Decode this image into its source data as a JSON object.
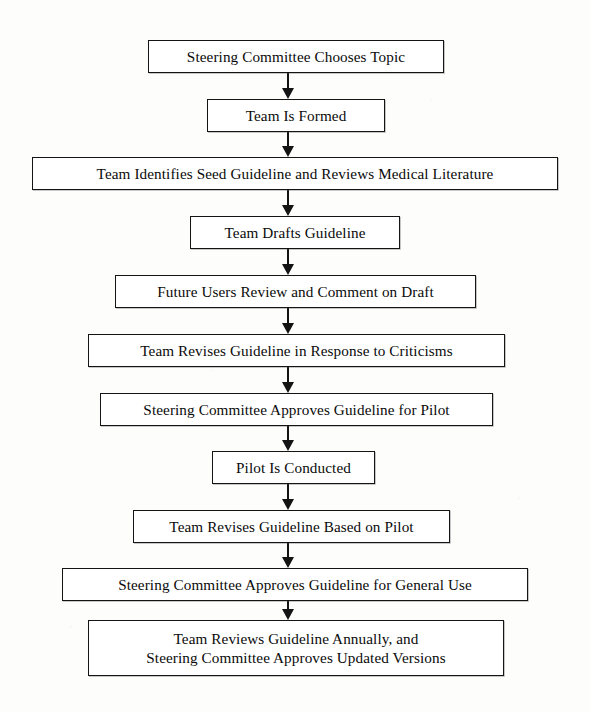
{
  "diagram": {
    "type": "flowchart",
    "orientation": "top-to-bottom",
    "title": "",
    "style": {
      "node_fill": "#ffffff",
      "node_border": "#141414",
      "text_color": "#0a0a0a",
      "arrow_color": "#141414",
      "page_background": "#fdfdfc"
    },
    "nodes": [
      {
        "id": "n1",
        "label": "Steering Committee Chooses Topic",
        "shape": "rectangle",
        "x": 148,
        "y": 40,
        "width": 296,
        "height": 33
      },
      {
        "id": "n2",
        "label": "Team Is Formed",
        "shape": "rectangle",
        "x": 207,
        "y": 99,
        "width": 178,
        "height": 33
      },
      {
        "id": "n3",
        "label": "Team Identifies Seed Guideline and Reviews Medical Literature",
        "shape": "rectangle",
        "x": 32,
        "y": 157,
        "width": 526,
        "height": 33
      },
      {
        "id": "n4",
        "label": "Team Drafts Guideline",
        "shape": "rectangle",
        "x": 190,
        "y": 216,
        "width": 210,
        "height": 33
      },
      {
        "id": "n5",
        "label": "Future Users Review and Comment on Draft",
        "shape": "rectangle",
        "x": 115,
        "y": 275,
        "width": 361,
        "height": 33
      },
      {
        "id": "n6",
        "label": "Team Revises Guideline in Response to Criticisms",
        "shape": "rectangle",
        "x": 88,
        "y": 334,
        "width": 417,
        "height": 33
      },
      {
        "id": "n7",
        "label": "Steering Committee Approves Guideline for Pilot",
        "shape": "rectangle",
        "x": 100,
        "y": 393,
        "width": 393,
        "height": 33
      },
      {
        "id": "n8",
        "label": "Pilot Is Conducted",
        "shape": "rectangle",
        "x": 212,
        "y": 451,
        "width": 163,
        "height": 33
      },
      {
        "id": "n9",
        "label": "Team Revises Guideline Based on Pilot",
        "shape": "rectangle",
        "x": 133,
        "y": 510,
        "width": 317,
        "height": 33
      },
      {
        "id": "n10",
        "label": "Steering Committee Approves Guideline for General Use",
        "shape": "rectangle",
        "x": 62,
        "y": 568,
        "width": 466,
        "height": 33
      },
      {
        "id": "n11",
        "label": "Team Reviews Guideline Annually, and\nSteering Committee Approves Updated Versions",
        "shape": "rectangle",
        "x": 88,
        "y": 620,
        "width": 416,
        "height": 56
      }
    ],
    "edges": [
      {
        "id": "e1",
        "from": "n1",
        "to": "n2",
        "arrow": "down-arrow",
        "x": 288,
        "y": 73,
        "length": 26
      },
      {
        "id": "e2",
        "from": "n2",
        "to": "n3",
        "arrow": "down-arrow",
        "x": 288,
        "y": 132,
        "length": 25
      },
      {
        "id": "e3",
        "from": "n3",
        "to": "n4",
        "arrow": "down-arrow",
        "x": 288,
        "y": 190,
        "length": 26
      },
      {
        "id": "e4",
        "from": "n4",
        "to": "n5",
        "arrow": "down-arrow",
        "x": 288,
        "y": 249,
        "length": 26
      },
      {
        "id": "e5",
        "from": "n5",
        "to": "n6",
        "arrow": "down-arrow",
        "x": 288,
        "y": 308,
        "length": 26
      },
      {
        "id": "e6",
        "from": "n6",
        "to": "n7",
        "arrow": "down-arrow",
        "x": 288,
        "y": 367,
        "length": 26
      },
      {
        "id": "e7",
        "from": "n7",
        "to": "n8",
        "arrow": "down-arrow",
        "x": 288,
        "y": 426,
        "length": 25
      },
      {
        "id": "e8",
        "from": "n8",
        "to": "n9",
        "arrow": "down-arrow",
        "x": 288,
        "y": 484,
        "length": 26
      },
      {
        "id": "e9",
        "from": "n9",
        "to": "n10",
        "arrow": "down-arrow",
        "x": 288,
        "y": 543,
        "length": 25
      },
      {
        "id": "e10",
        "from": "n10",
        "to": "n11",
        "arrow": "down-arrow",
        "x": 288,
        "y": 601,
        "length": 19
      }
    ]
  }
}
